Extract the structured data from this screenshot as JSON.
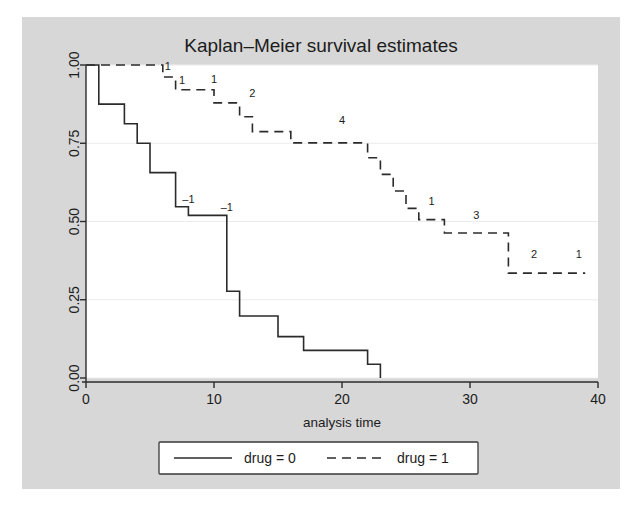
{
  "figure": {
    "title": "Kaplan–Meier survival estimates",
    "background_color": "#d7d7d7",
    "plot_background_color": "#ffffff",
    "line_color": "#2b2b2b",
    "grid_color": "#ececed"
  },
  "axes": {
    "x_label": "analysis time",
    "y_label": "",
    "x_ticks": [
      "0",
      "10",
      "20",
      "30",
      "40"
    ],
    "y_ticks": [
      "0.00",
      "0.25",
      "0.50",
      "0.75",
      "1.00"
    ]
  },
  "legend": {
    "entries": [
      {
        "label": "drug = 0",
        "style": "solid"
      },
      {
        "label": "drug = 1",
        "style": "dashed"
      }
    ]
  },
  "chart_data": {
    "type": "line",
    "subtype": "kaplan-meier-step",
    "title": "Kaplan–Meier survival estimates",
    "xlabel": "analysis time",
    "ylabel": "",
    "xlim": [
      0,
      40
    ],
    "ylim": [
      0,
      1
    ],
    "xticks": [
      0,
      10,
      20,
      30,
      40
    ],
    "yticks": [
      0,
      0.25,
      0.5,
      0.75,
      1.0
    ],
    "grid": true,
    "legend_position": "below",
    "series": [
      {
        "name": "drug = 0",
        "style": "solid",
        "steps": [
          {
            "t": 0,
            "s": 1.0
          },
          {
            "t": 1,
            "s": 1.0
          },
          {
            "t": 1,
            "s": 0.875
          },
          {
            "t": 3,
            "s": 0.875
          },
          {
            "t": 3,
            "s": 0.8125
          },
          {
            "t": 4,
            "s": 0.8125
          },
          {
            "t": 4,
            "s": 0.75
          },
          {
            "t": 5,
            "s": 0.75
          },
          {
            "t": 5,
            "s": 0.6562
          },
          {
            "t": 7,
            "s": 0.6562
          },
          {
            "t": 7,
            "s": 0.5469
          },
          {
            "t": 8,
            "s": 0.5469
          },
          {
            "t": 8,
            "s": 0.5195
          },
          {
            "t": 11,
            "s": 0.5195
          },
          {
            "t": 11,
            "s": 0.2773
          },
          {
            "t": 12,
            "s": 0.2773
          },
          {
            "t": 12,
            "s": 0.1982
          },
          {
            "t": 15,
            "s": 0.1982
          },
          {
            "t": 15,
            "s": 0.1321
          },
          {
            "t": 17,
            "s": 0.1321
          },
          {
            "t": 17,
            "s": 0.0881
          },
          {
            "t": 22,
            "s": 0.0881
          },
          {
            "t": 22,
            "s": 0.044
          },
          {
            "t": 23,
            "s": 0.044
          },
          {
            "t": 23,
            "s": 0.0
          }
        ],
        "annotations": [
          {
            "t": 8,
            "s": 0.5469,
            "text": "–1"
          },
          {
            "t": 11,
            "s": 0.5195,
            "text": "–1"
          }
        ]
      },
      {
        "name": "drug = 1",
        "style": "dashed",
        "steps": [
          {
            "t": 0,
            "s": 1.0
          },
          {
            "t": 6,
            "s": 1.0
          },
          {
            "t": 6,
            "s": 0.9615
          },
          {
            "t": 7,
            "s": 0.9615
          },
          {
            "t": 7,
            "s": 0.9211
          },
          {
            "t": 10,
            "s": 0.9211
          },
          {
            "t": 10,
            "s": 0.879
          },
          {
            "t": 12,
            "s": 0.879
          },
          {
            "t": 12,
            "s": 0.8347
          },
          {
            "t": 13,
            "s": 0.8347
          },
          {
            "t": 13,
            "s": 0.787
          },
          {
            "t": 16,
            "s": 0.787
          },
          {
            "t": 16,
            "s": 0.7513
          },
          {
            "t": 22,
            "s": 0.7513
          },
          {
            "t": 22,
            "s": 0.7035
          },
          {
            "t": 23,
            "s": 0.7035
          },
          {
            "t": 23,
            "s": 0.6507
          },
          {
            "t": 24,
            "s": 0.6507
          },
          {
            "t": 24,
            "s": 0.5973
          },
          {
            "t": 25,
            "s": 0.5973
          },
          {
            "t": 25,
            "s": 0.5418
          },
          {
            "t": 26,
            "s": 0.5418
          },
          {
            "t": 26,
            "s": 0.5059
          },
          {
            "t": 28,
            "s": 0.5059
          },
          {
            "t": 28,
            "s": 0.4634
          },
          {
            "t": 33,
            "s": 0.4634
          },
          {
            "t": 33,
            "s": 0.3352
          },
          {
            "t": 39,
            "s": 0.3352
          }
        ],
        "annotations": [
          {
            "t": 6.4,
            "s": 0.972,
            "text": "1"
          },
          {
            "t": 7.5,
            "s": 0.925,
            "text": "1"
          },
          {
            "t": 10.0,
            "s": 0.93,
            "text": "1"
          },
          {
            "t": 13.0,
            "s": 0.884,
            "text": "2"
          },
          {
            "t": 20.0,
            "s": 0.8,
            "text": "4"
          },
          {
            "t": 27.0,
            "s": 0.54,
            "text": "1"
          },
          {
            "t": 30.5,
            "s": 0.495,
            "text": "3"
          },
          {
            "t": 35.0,
            "s": 0.37,
            "text": "2"
          },
          {
            "t": 38.5,
            "s": 0.372,
            "text": "1"
          }
        ]
      }
    ]
  }
}
